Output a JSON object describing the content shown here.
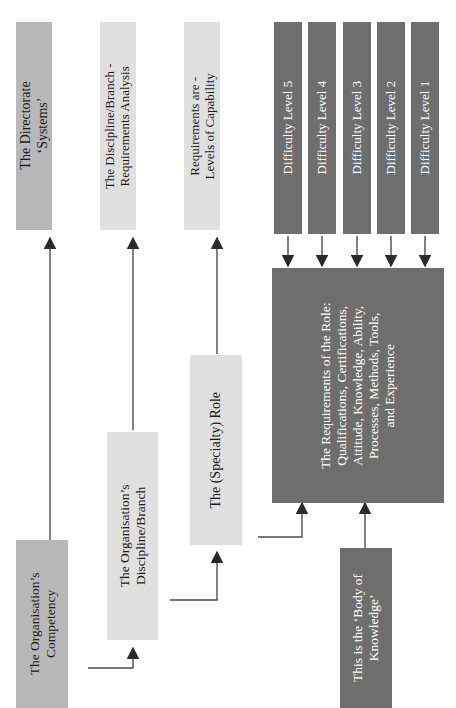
{
  "diagram": {
    "colors": {
      "dark": "#6e6e6e",
      "mid": "#b8b8b8",
      "light": "#e0e0e0",
      "text_light": "#ffffff",
      "text_dark": "#1a1a1a",
      "connector": "#4d4d4d"
    },
    "nodes": {
      "directorate": {
        "label": "The Directorate\n'Systems'",
        "line1": "The Directorate",
        "line2": "‘Systems’",
        "style": "mid"
      },
      "discipline_branch_analysis": {
        "line1": "The Discipline/Branch -",
        "line2": "Requirements Analysis",
        "style": "light"
      },
      "requirements_levels": {
        "line1": "Requirements are -",
        "line2": "Levels of Capability",
        "style": "light"
      },
      "difficulty_5": {
        "label": "Difficulty Level 5",
        "style": "dark"
      },
      "difficulty_4": {
        "label": "Difficulty Level 4",
        "style": "dark"
      },
      "difficulty_3": {
        "label": "Difficulty Level 3",
        "style": "dark"
      },
      "difficulty_2": {
        "label": "Difficulty Level 2",
        "style": "dark"
      },
      "difficulty_1": {
        "label": "Difficulty Level 1",
        "style": "dark"
      },
      "requirements_of_role": {
        "line1": "The Requirements of the Role:",
        "line2": "Qualifications, Certifications,",
        "line3": "Attitude, Knowledge, Ability,",
        "line4": "Processes, Methods, Tools,",
        "line5": "and Experience",
        "style": "dark"
      },
      "specialty_role": {
        "label": "The (Specialty) Role",
        "style": "light"
      },
      "organisation_competency": {
        "line1": "The Organisation’s",
        "line2": "Competency",
        "style": "mid"
      },
      "organisation_discipline_branch": {
        "line1": "The Organisation’s",
        "line2": "Discipline/Branch",
        "style": "light"
      },
      "body_of_knowledge": {
        "line1": "This is the ‘Body of",
        "line2": "Knowledge’",
        "style": "dark"
      }
    }
  }
}
